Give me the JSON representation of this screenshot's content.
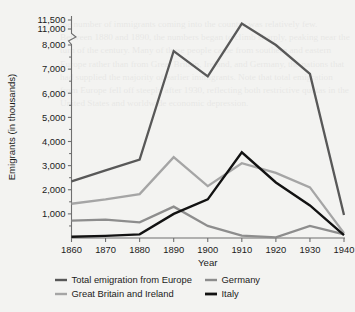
{
  "figure": {
    "background_color": "#f3f3f1",
    "border_color": "#e3e3e1"
  },
  "axes": {
    "y_title": "Emigrants (in thousands)",
    "x_title": "Year",
    "y_tick_labels": [
      "11,500",
      "11,000",
      "8,000",
      "7,000",
      "6,000",
      "5,000",
      "4,000",
      "3,000",
      "2,000",
      "1,000"
    ],
    "x_tick_labels": [
      "1860",
      "1870",
      "1880",
      "1890",
      "1900",
      "1910",
      "1920",
      "1930",
      "1940"
    ],
    "axis_break": "between 11,000 and 8,000",
    "grid": "off",
    "axis_color": "#6f6f6f"
  },
  "legend": {
    "position": "below-plot",
    "entries": [
      {
        "label": "Total emigration from Europe",
        "color": "#585858"
      },
      {
        "label": "Germany",
        "color": "#8d8d8d"
      },
      {
        "label": "Great Britain and Ireland",
        "color": "#a5a5a5"
      },
      {
        "label": "Italy",
        "color": "#121212"
      }
    ]
  },
  "chart_data": {
    "type": "line",
    "title": "",
    "subtitle": "",
    "xlabel": "Year",
    "ylabel": "Emigrants (in thousands)",
    "x": [
      1860,
      1870,
      1880,
      1890,
      1900,
      1910,
      1920,
      1930,
      1940
    ],
    "xlim": [
      1860,
      1940
    ],
    "ylim": [
      0,
      11500
    ],
    "y_axis_break": {
      "from": 8000,
      "to": 11000
    },
    "grid": false,
    "legend_position": "bottom",
    "series": [
      {
        "name": "Total emigration from Europe",
        "color": "#585858",
        "values": [
          2350,
          2800,
          3250,
          7750,
          6700,
          11300,
          8000,
          6800,
          950
        ]
      },
      {
        "name": "Great Britain and Ireland",
        "color": "#a5a5a5",
        "values": [
          1420,
          1600,
          1820,
          3350,
          2150,
          3100,
          2700,
          2100,
          200
        ]
      },
      {
        "name": "Germany",
        "color": "#8d8d8d",
        "values": [
          720,
          760,
          650,
          1300,
          500,
          100,
          30,
          500,
          150
        ]
      },
      {
        "name": "Italy",
        "color": "#121212",
        "values": [
          50,
          90,
          150,
          1000,
          1600,
          3550,
          2300,
          1350,
          120
        ]
      }
    ]
  },
  "ghost_text": "the number of immigrants coming into the country was relatively few. Between 1880 and 1890, the numbers began to climb sharply, peaking near the turn of the century. Many of these people came from southern and eastern Europe rather than from Great Britain, Ireland, and Germany, the nations that had supplied the majority of earlier immigrants. Note that total emigration from Europe fell off steeply after 1930, reflecting both restrictive quotas in the United States and worldwide economic depression."
}
